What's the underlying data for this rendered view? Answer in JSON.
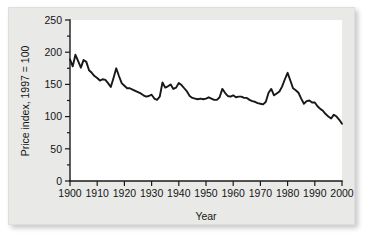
{
  "figure": {
    "panel_bg": "#e9e9e7",
    "plot_bg": "#ffffff",
    "line_color": "#171717"
  },
  "chart_data": {
    "type": "line",
    "title": "",
    "xlabel": "Year",
    "ylabel": "Price index,  1997 = 100",
    "xlim": [
      1900,
      2000
    ],
    "ylim": [
      0,
      250
    ],
    "xticks": [
      1900,
      1910,
      1920,
      1930,
      1940,
      1950,
      1960,
      1970,
      1980,
      1990,
      2000
    ],
    "yticks": [
      0,
      50,
      100,
      150,
      200,
      250
    ],
    "xtick_labels": [
      "1900",
      "1910",
      "1920",
      "1930",
      "1940",
      "1950",
      "1960",
      "1970",
      "1980",
      "1990",
      "2000"
    ],
    "ytick_labels": [
      "0",
      "50",
      "100",
      "150",
      "200",
      "250"
    ],
    "minor_yticks": [
      25,
      75,
      125,
      175,
      225
    ],
    "grid": false,
    "legend": false,
    "series": [
      {
        "name": "Price index",
        "x": [
          1900,
          1901,
          1902,
          1903,
          1904,
          1905,
          1906,
          1907,
          1908,
          1909,
          1910,
          1911,
          1912,
          1913,
          1914,
          1915,
          1916,
          1917,
          1918,
          1919,
          1920,
          1921,
          1922,
          1923,
          1924,
          1925,
          1926,
          1927,
          1928,
          1929,
          1930,
          1931,
          1932,
          1933,
          1934,
          1935,
          1936,
          1937,
          1938,
          1939,
          1940,
          1941,
          1942,
          1943,
          1944,
          1945,
          1946,
          1947,
          1948,
          1949,
          1950,
          1951,
          1952,
          1953,
          1954,
          1955,
          1956,
          1957,
          1958,
          1959,
          1960,
          1961,
          1962,
          1963,
          1964,
          1965,
          1966,
          1967,
          1968,
          1969,
          1970,
          1971,
          1972,
          1973,
          1974,
          1975,
          1976,
          1977,
          1978,
          1979,
          1980,
          1981,
          1982,
          1983,
          1984,
          1985,
          1986,
          1987,
          1988,
          1989,
          1990,
          1991,
          1992,
          1993,
          1994,
          1995,
          1996,
          1997,
          1998,
          1999,
          2000
        ],
        "values": [
          189,
          178,
          196,
          186,
          176,
          188,
          185,
          172,
          168,
          163,
          160,
          156,
          158,
          157,
          152,
          146,
          160,
          175,
          163,
          152,
          148,
          144,
          144,
          142,
          140,
          138,
          136,
          133,
          131,
          132,
          134,
          128,
          126,
          131,
          153,
          145,
          147,
          150,
          143,
          145,
          152,
          149,
          144,
          139,
          132,
          129,
          128,
          127,
          128,
          127,
          128,
          130,
          128,
          126,
          126,
          130,
          143,
          137,
          132,
          131,
          133,
          130,
          131,
          131,
          129,
          129,
          126,
          124,
          123,
          121,
          120,
          119,
          123,
          137,
          143,
          133,
          136,
          139,
          147,
          158,
          168,
          156,
          144,
          141,
          137,
          128,
          120,
          124,
          125,
          122,
          122,
          116,
          112,
          109,
          104,
          100,
          97,
          103,
          100,
          95,
          89
        ]
      }
    ]
  }
}
